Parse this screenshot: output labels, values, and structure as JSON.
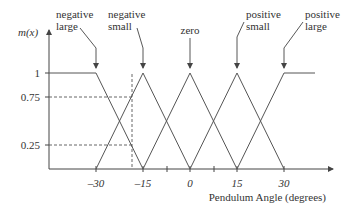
{
  "diagram": {
    "type": "fuzzy-membership-functions",
    "y_axis": {
      "label": "m(x)",
      "ticks": [
        {
          "label": "1",
          "value": 1
        },
        {
          "label": "0.75",
          "value": 0.75
        },
        {
          "label": "0.25",
          "value": 0.25
        }
      ]
    },
    "x_axis": {
      "label": "Pendulum Angle (degrees)",
      "ticks": [
        {
          "label": "–30",
          "value": -30
        },
        {
          "label": "–15",
          "value": -15
        },
        {
          "label": "0",
          "value": 0
        },
        {
          "label": "15",
          "value": 15
        },
        {
          "label": "30",
          "value": 30
        }
      ]
    },
    "sets": [
      {
        "name": "negative large",
        "line1": "negative",
        "line2": "large"
      },
      {
        "name": "negative small",
        "line1": "negative",
        "line2": "small"
      },
      {
        "name": "zero",
        "line1": "zero",
        "line2": ""
      },
      {
        "name": "positive small",
        "line1": "positive",
        "line2": "small"
      },
      {
        "name": "positive large",
        "line1": "positive",
        "line2": "large"
      }
    ],
    "dashed_guides": {
      "vertical_x": -18.75,
      "horizontal_levels": [
        0.75,
        0.25
      ]
    }
  }
}
